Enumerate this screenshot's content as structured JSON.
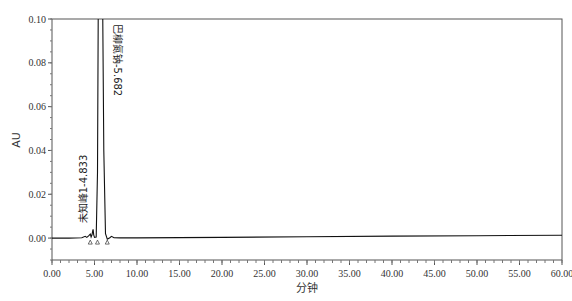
{
  "chart_data": {
    "type": "line",
    "title": "",
    "xlabel": "分钟",
    "ylabel": "AU",
    "xlim": [
      0,
      60
    ],
    "ylim": [
      -0.01,
      0.1
    ],
    "grid": false,
    "legend": null,
    "x_ticks": [
      0,
      5,
      10,
      15,
      20,
      25,
      30,
      35,
      40,
      45,
      50,
      55,
      60
    ],
    "x_tick_labels": [
      "0.00",
      "5.00",
      "10.00",
      "15.00",
      "20.00",
      "25.00",
      "30.00",
      "35.00",
      "40.00",
      "45.00",
      "50.00",
      "55.00",
      "60.00"
    ],
    "y_ticks": [
      0.0,
      0.02,
      0.04,
      0.06,
      0.08,
      0.1
    ],
    "y_tick_labels": [
      "0.00",
      "0.02",
      "0.04",
      "0.06",
      "0.08",
      "0.10"
    ],
    "annotations": [
      {
        "text": "未知峰1-4.833",
        "x": 4.833
      },
      {
        "text": "巴柳氮钠-5.682",
        "x": 5.682
      }
    ],
    "peaks": [
      {
        "name": "未知峰1",
        "rt": 4.833,
        "height": 0.004
      },
      {
        "name": "巴柳氮钠",
        "rt": 5.682,
        "height": "off-scale (>0.10)"
      }
    ],
    "series": [
      {
        "name": "chromatogram",
        "x": [
          0,
          2,
          3.5,
          3.9,
          4.1,
          4.3,
          4.5,
          4.6,
          4.7,
          4.8,
          4.833,
          4.9,
          5.0,
          5.2,
          5.35,
          5.45,
          5.55,
          5.682,
          5.8,
          5.95,
          6.1,
          6.3,
          6.5,
          6.8,
          7.0,
          7.3,
          8,
          10,
          20,
          30,
          40,
          50,
          60
        ],
        "y": [
          0.0,
          0.0,
          0.0002,
          0.0008,
          0.0003,
          0.001,
          0.0018,
          0.0005,
          0.0015,
          0.0035,
          0.004,
          0.0015,
          0.0003,
          0.0005,
          0.03,
          0.11,
          0.11,
          0.11,
          0.11,
          0.11,
          0.04,
          0.002,
          -0.0005,
          0.0002,
          0.0008,
          0.0002,
          0.0001,
          0.0001,
          0.0003,
          0.0006,
          0.0009,
          0.0011,
          0.0013
        ]
      }
    ]
  }
}
